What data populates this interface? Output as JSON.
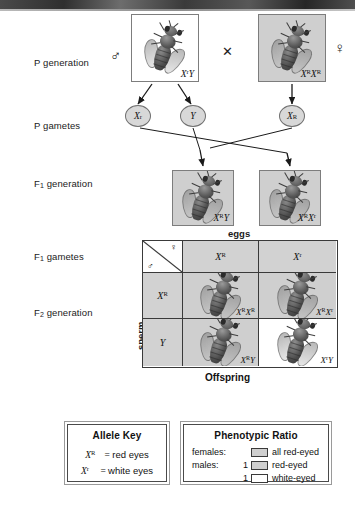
{
  "diagram": {
    "rows": [
      {
        "label": "P generation",
        "sub": ""
      },
      {
        "label": "P gametes",
        "sub": ""
      },
      {
        "label": "F",
        "sub": "1",
        "suffix": " generation"
      },
      {
        "label": "F",
        "sub": "1",
        "suffix": " gametes"
      },
      {
        "label": "F",
        "sub": "2",
        "suffix": " generation"
      }
    ]
  },
  "row_labels": {
    "p_generation": "P generation",
    "p_gametes": "P gametes",
    "f1_generation_pre": "F",
    "f1_generation_sub": "1",
    "f1_generation_post": " generation",
    "f1_gametes_pre": "F",
    "f1_gametes_sub": "1",
    "f1_gametes_post": " gametes",
    "f2_generation_pre": "F",
    "f2_generation_sub": "2",
    "f2_generation_post": " generation"
  },
  "p_generation": {
    "male": {
      "genotype_base": "X",
      "genotype_sup": "r",
      "genotype_tail": "Y",
      "symbol": "♂",
      "shaded": false
    },
    "cross_symbol": "✕",
    "female": {
      "genotype_base": "X",
      "genotype_sup": "R",
      "genotype_tail": "X",
      "genotype_sup2": "R",
      "symbol": "♀",
      "shaded": true
    }
  },
  "p_gametes": [
    {
      "base": "X",
      "sup": "r"
    },
    {
      "base": "Y",
      "sup": ""
    },
    {
      "base": "X",
      "sup": "R"
    }
  ],
  "f1_generation": [
    {
      "base": "X",
      "sup": "R",
      "tail": "Y",
      "sup2": "",
      "shaded": true
    },
    {
      "base": "X",
      "sup": "R",
      "tail": "X",
      "sup2": "r",
      "shaded": true
    }
  ],
  "punnett": {
    "top_axis_label": "eggs",
    "side_axis_label": "sperm",
    "bottom_label": "Offspring",
    "corner": {
      "female_symbol": "♀",
      "male_symbol": "♂"
    },
    "col_headers": [
      {
        "base": "X",
        "sup": "R"
      },
      {
        "base": "X",
        "sup": "r"
      }
    ],
    "row_headers": [
      {
        "base": "X",
        "sup": "R"
      },
      {
        "base": "Y",
        "sup": ""
      }
    ],
    "cells": [
      {
        "base": "X",
        "sup": "R",
        "tail": "X",
        "sup2": "R",
        "shaded": true
      },
      {
        "base": "X",
        "sup": "R",
        "tail": "X",
        "sup2": "r",
        "shaded": true
      },
      {
        "base": "X",
        "sup": "R",
        "tail": "Y",
        "sup2": "",
        "shaded": true
      },
      {
        "base": "X",
        "sup": "r",
        "tail": "Y",
        "sup2": "",
        "shaded": false
      }
    ]
  },
  "allele_key": {
    "title": "Allele Key",
    "lines": [
      {
        "base": "X",
        "sup": "R",
        "eq": " = ",
        "text": "red eyes"
      },
      {
        "base": "X",
        "sup": "r",
        "eq": " = ",
        "text": "white eyes"
      }
    ]
  },
  "phenotypic_ratio": {
    "title": "Phenotypic Ratio",
    "rows": [
      {
        "label": "females:",
        "count": "",
        "swatch": "shaded",
        "text": "all red-eyed"
      },
      {
        "label": "males:",
        "count": "1",
        "swatch": "shaded",
        "text": "red-eyed"
      },
      {
        "label": "",
        "count": "1",
        "swatch": "white",
        "text": "white-eyed"
      }
    ]
  },
  "colors": {
    "shaded_fill": "#cfcfcf",
    "plain_fill": "#ffffff",
    "border": "#3a3a3a",
    "text": "#111111"
  }
}
